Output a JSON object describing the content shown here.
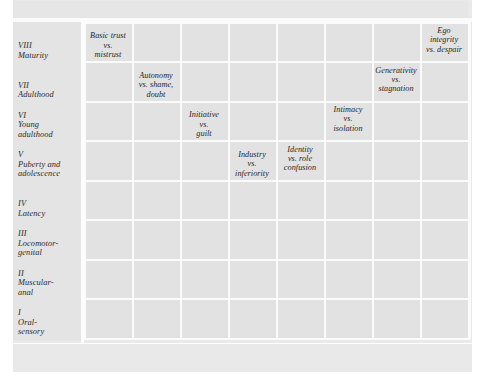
{
  "figure": {
    "kind": "erikson-psychosocial-stages-matrix",
    "header_band": "",
    "colors": {
      "page_background": "#e9e9e9",
      "cell_fill": "#e2e2e2",
      "gridline": "#fbfbfb",
      "stub_fill": "#e4e4e4",
      "text": "#262626"
    }
  },
  "chart_data": {
    "type": "table",
    "title": "",
    "xlabel": "",
    "ylabel": "",
    "columns": 8,
    "rows": 8,
    "x_tick_labels": [
      "1",
      "2",
      "3",
      "4",
      "5",
      "6",
      "7",
      "8"
    ],
    "y_categories": [
      {
        "numeral": "I",
        "name": "Oral-\nsensory"
      },
      {
        "numeral": "II",
        "name": "Muscular-\nanal"
      },
      {
        "numeral": "III",
        "name": "Locomotor-\ngenital"
      },
      {
        "numeral": "IV",
        "name": "Latency"
      },
      {
        "numeral": "V",
        "name": "Puberty and\nadolescence"
      },
      {
        "numeral": "VI",
        "name": "Young\nadulthood"
      },
      {
        "numeral": "VII",
        "name": "Adulthood"
      },
      {
        "numeral": "VIII",
        "name": "Maturity"
      }
    ],
    "cells": [
      {
        "row": 1,
        "col": 1,
        "text": "Basic trust\nvs.\nmistrust"
      },
      {
        "row": 2,
        "col": 2,
        "text": "Autonomy\nvs. shame,\ndoubt"
      },
      {
        "row": 3,
        "col": 3,
        "text": "Initiative\nvs.\nguilt"
      },
      {
        "row": 4,
        "col": 4,
        "text": "Industry\nvs.\ninferiority"
      },
      {
        "row": 5,
        "col": 5,
        "text": "Identity\nvs. role\nconfusion"
      },
      {
        "row": 6,
        "col": 6,
        "text": "Intimacy\nvs.\nisolation"
      },
      {
        "row": 7,
        "col": 7,
        "text": "Generativity\nvs.\nstagnation"
      },
      {
        "row": 8,
        "col": 8,
        "text": "Ego\nintegrity\nvs. despair"
      }
    ]
  },
  "stage_rows": [
    {
      "numeral": "VIII",
      "name": "Maturity"
    },
    {
      "numeral": "VII",
      "name": "Adulthood"
    },
    {
      "numeral": "VI",
      "name": "Young\nadulthood"
    },
    {
      "numeral": "V",
      "name": "Puberty and\nadolescence"
    },
    {
      "numeral": "IV",
      "name": "Latency"
    },
    {
      "numeral": "III",
      "name": "Locomotor-\ngenital"
    },
    {
      "numeral": "II",
      "name": "Muscular-\nanal"
    },
    {
      "numeral": "I",
      "name": "Oral-\nsensory"
    }
  ],
  "crisis_entries": [
    "Ego\nintegrity\nvs. despair",
    "Generativity\nvs.\nstagnation",
    "Intimacy\nvs.\nisolation",
    "Identity\nvs. role\nconfusion",
    "Industry\nvs.\ninferiority",
    "Initiative\nvs.\nguilt",
    "Autonomy\nvs. shame,\ndoubt",
    "Basic trust\nvs.\nmistrust"
  ],
  "x_axis": {
    "ticks": [
      "1",
      "2",
      "3",
      "4",
      "5",
      "6",
      "7",
      "8"
    ]
  }
}
